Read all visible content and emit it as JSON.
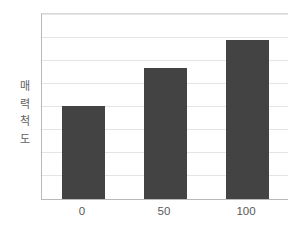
{
  "chart_data": {
    "type": "bar",
    "title": "",
    "subtitle": "",
    "xlabel": "",
    "ylabel": "매력척도",
    "ylabel_chars": [
      "매",
      "력",
      "척",
      "도"
    ],
    "categories": [
      "0",
      "50",
      "100"
    ],
    "values": [
      4.05,
      5.7,
      6.9
    ],
    "series": [
      {
        "name": "매력척도",
        "values": [
          4.05,
          5.7,
          6.9
        ]
      }
    ],
    "ylim": [
      0,
      8
    ],
    "xtick_labels": [
      "0",
      "50",
      "100"
    ],
    "ytick_labels": [],
    "gridlines": {
      "horizontal": true,
      "vertical": false,
      "count": 8,
      "values": [
        1,
        2,
        3,
        4,
        5,
        6,
        7,
        8
      ]
    },
    "legend": {
      "visible": false,
      "position": "none",
      "entries": []
    },
    "annotations": [],
    "axis": {
      "y_axis_visible": true,
      "x_axis_visible": true,
      "y_tick_labels_visible": false
    },
    "colors": {
      "bar": "#434343",
      "background": "#ffffff",
      "gridline": "#e4e4e4",
      "axis_line": "#b9b9b9",
      "tick_label": "#585858",
      "axis_title": "#5e5e5e"
    }
  }
}
